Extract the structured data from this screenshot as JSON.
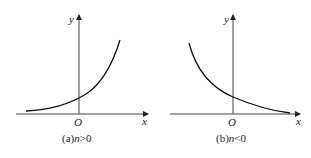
{
  "figures": [
    {
      "id": "a",
      "caption_prefix": "(a)",
      "caption_var": "n",
      "caption_rel": ">0",
      "x_label": "x",
      "y_label": "y",
      "origin_label": "O",
      "curve": "increasing exponential"
    },
    {
      "id": "b",
      "caption_prefix": "(b)",
      "caption_var": "n",
      "caption_rel": "<0",
      "x_label": "x",
      "y_label": "y",
      "origin_label": "O",
      "curve": "decreasing exponential"
    }
  ],
  "colors": {
    "stroke": "#222222",
    "background": "#ffffff"
  }
}
